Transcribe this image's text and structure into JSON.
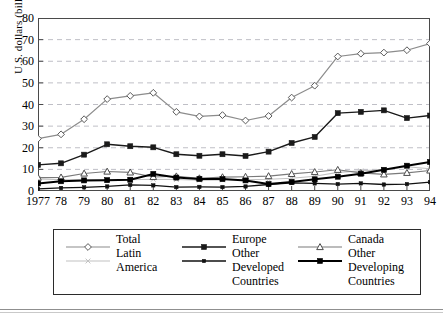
{
  "figure": {
    "frame_color": "#4a4a4a",
    "background": "#ffffff",
    "gridline_color": "#bfbfc6"
  },
  "chart_data": {
    "type": "line",
    "title": "",
    "xlabel": "",
    "ylabel": "U.S. dollars (billions)",
    "ylim": [
      0,
      80
    ],
    "yticks": [
      0,
      10,
      20,
      30,
      40,
      50,
      60,
      70,
      80
    ],
    "ytick_labels": [
      "0",
      "10",
      "20",
      "30",
      "40",
      "50",
      "60",
      "70",
      "80"
    ],
    "grid": "horizontal-dashed",
    "legend_position": "below-plot",
    "categories": [
      "1977",
      "78",
      "79",
      "80",
      "81",
      "82",
      "83",
      "84",
      "85",
      "86",
      "87",
      "88",
      "89",
      "90",
      "91",
      "92",
      "93",
      "94"
    ],
    "x": [
      1977,
      1978,
      1979,
      1980,
      1981,
      1982,
      1983,
      1984,
      1985,
      1986,
      1987,
      1988,
      1989,
      1990,
      1991,
      1992,
      1993,
      1994
    ],
    "series": [
      {
        "name": "Total",
        "color": "#8c8c8c",
        "marker": "open-diamond",
        "marker_fill": "#ffffff",
        "line_width": 1.2,
        "values": [
          24.2,
          26.2,
          33.2,
          42.5,
          44.0,
          45.4,
          36.6,
          34.5,
          35.1,
          32.6,
          34.7,
          43.2,
          48.7,
          62.2,
          63.5,
          64.0,
          65.1,
          68.2
        ]
      },
      {
        "name": "Europe",
        "color": "#1a1a1a",
        "marker": "filled-square",
        "marker_fill": "#1a1a1a",
        "line_width": 1.4,
        "values": [
          12.1,
          12.8,
          16.8,
          21.6,
          20.7,
          20.2,
          17.0,
          16.3,
          17.0,
          16.2,
          18.2,
          22.2,
          25.0,
          36.0,
          36.6,
          37.3,
          33.7,
          34.9
        ]
      },
      {
        "name": "Canada",
        "color": "#7a7a7a",
        "marker": "open-triangle",
        "marker_fill": "#ffffff",
        "line_width": 1.1,
        "values": [
          6.2,
          6.3,
          8.1,
          9.0,
          8.6,
          6.5,
          6.8,
          5.9,
          6.4,
          6.6,
          6.9,
          7.9,
          8.8,
          9.8,
          8.4,
          7.7,
          8.4,
          9.5
        ]
      },
      {
        "name": "Latin America",
        "color": "#c2c2c2",
        "marker": "small-x",
        "marker_fill": "#c2c2c2",
        "line_width": 1.1,
        "values": [
          5.6,
          5.2,
          5.3,
          5.3,
          5.2,
          5.4,
          5.3,
          5.0,
          5.1,
          5.2,
          5.4,
          5.9,
          6.8,
          8.6,
          9.3,
          9.9,
          11.2,
          10.3
        ]
      },
      {
        "name": "Other Developed Countries",
        "color": "#111111",
        "marker": "small-square",
        "marker_fill": "#111111",
        "line_width": 1.3,
        "values": [
          1.0,
          1.4,
          1.7,
          2.1,
          2.8,
          2.6,
          1.8,
          1.9,
          1.8,
          2.1,
          3.0,
          3.8,
          3.5,
          3.2,
          3.5,
          3.0,
          3.2,
          4.1
        ]
      },
      {
        "name": "Other Developing Countries",
        "color": "#000000",
        "marker": "filled-square",
        "marker_fill": "#000000",
        "line_width": 2.0,
        "values": [
          3.5,
          4.5,
          4.9,
          5.0,
          5.2,
          7.9,
          6.2,
          5.6,
          5.5,
          4.9,
          3.2,
          4.2,
          5.4,
          6.6,
          8.0,
          9.8,
          11.7,
          13.4
        ]
      }
    ]
  },
  "legend": {
    "columns": [
      {
        "entries": [
          {
            "label": "Total",
            "continuation": []
          },
          {
            "label": "Latin",
            "continuation": [
              "America"
            ]
          }
        ]
      },
      {
        "entries": [
          {
            "label": "Europe",
            "continuation": []
          },
          {
            "label": "Other",
            "continuation": [
              "Developed",
              "Countries"
            ]
          }
        ]
      },
      {
        "entries": [
          {
            "label": "Canada",
            "continuation": []
          },
          {
            "label": "Other",
            "continuation": [
              "Developing",
              "Countries"
            ]
          }
        ]
      }
    ]
  }
}
